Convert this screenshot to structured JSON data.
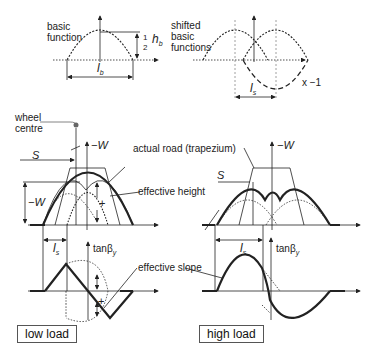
{
  "top_left": {
    "label": "basic\nfunction",
    "height_label": "½ h_b",
    "half": "1",
    "two": "2",
    "h": "h",
    "b_sub": "b",
    "length_label": "l",
    "length_sub": "b"
  },
  "top_right": {
    "label": "shifted\nbasic\nfunctions",
    "multiplier": "x −1",
    "shift_label": "l",
    "shift_sub": "s"
  },
  "middle": {
    "wheel_centre": "wheel\ncentre",
    "axis_label": "−W",
    "axis_label_right": "−W",
    "s_label": "S",
    "s_label_right": "S",
    "neg_w": "−W",
    "actual_road": "actual road (trapezium)",
    "effective_height": "effective height",
    "plus": "+"
  },
  "bottom": {
    "ls_left": "l",
    "ls_right": "l",
    "ls_sub": "s",
    "tan_left": "tanβ",
    "tan_right": "tanβ",
    "tan_sub": "y",
    "effective_slope": "effective slope",
    "plus": "+",
    "low_load": "low load",
    "high_load": "high load"
  }
}
